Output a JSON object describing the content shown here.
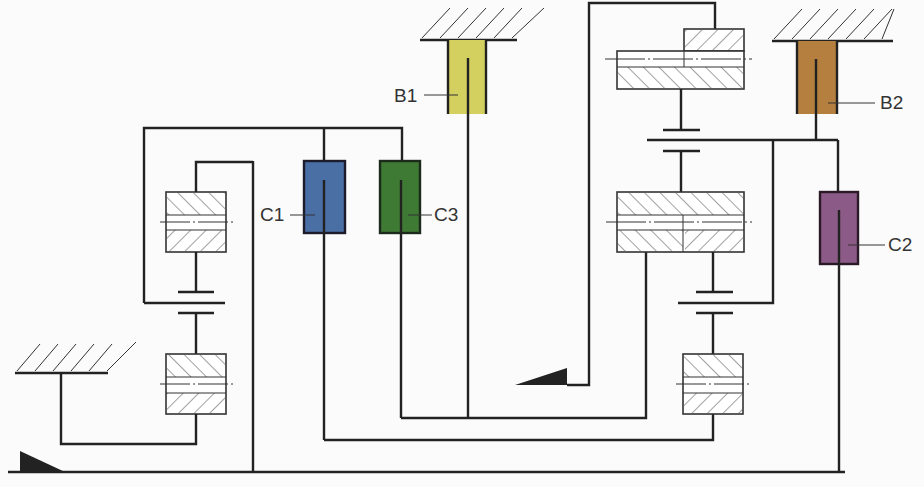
{
  "diagram": {
    "type": "planetary-gear-transmission-schematic",
    "components": {
      "clutches": [
        {
          "id": "C1",
          "label": "C1",
          "color": "#4a6fa5"
        },
        {
          "id": "C2",
          "label": "C2",
          "color": "#8c5a86"
        },
        {
          "id": "C3",
          "label": "C3",
          "color": "#3f7a35"
        }
      ],
      "brakes": [
        {
          "id": "B1",
          "label": "B1",
          "color": "#d4d060"
        },
        {
          "id": "B2",
          "label": "B2",
          "color": "#b5803f"
        }
      ]
    },
    "colors": {
      "line": "#222222",
      "background": "#fbfbfb",
      "hatch": "#444444"
    }
  }
}
